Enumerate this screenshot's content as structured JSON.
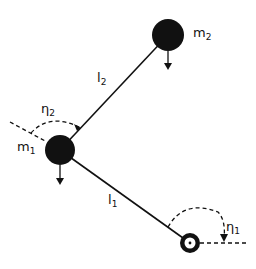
{
  "diagram": {
    "type": "double-pendulum",
    "labels": {
      "m1": {
        "base": "m",
        "sub": "1"
      },
      "m2": {
        "base": "m",
        "sub": "2"
      },
      "l1": {
        "base": "l",
        "sub": "1"
      },
      "l2": {
        "base": "l",
        "sub": "2"
      },
      "a1": {
        "base": "η",
        "sub": "1"
      },
      "a2": {
        "base": "η",
        "sub": "2"
      }
    },
    "colors": {
      "ink": "#111111",
      "background": "#ffffff"
    }
  }
}
